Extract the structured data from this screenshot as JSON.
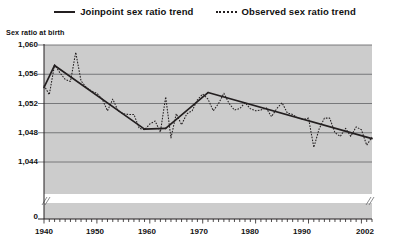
{
  "legend": {
    "items": [
      {
        "label": "Joinpoint sex ratio trend",
        "style": "solid",
        "color": "#231f20",
        "icon": "solid-line-icon"
      },
      {
        "label": "Observed sex ratio trend",
        "style": "dotted",
        "color": "#231f20",
        "icon": "dotted-line-icon"
      }
    ]
  },
  "axes": {
    "y_title": "Sex ratio at birth",
    "y_ticks": [
      "1,060",
      "1,056",
      "1,052",
      "1,048",
      "1,044",
      "0"
    ],
    "x_ticks": [
      "1940",
      "1950",
      "1960",
      "1970",
      "1980",
      "1990",
      "2002"
    ]
  },
  "colors": {
    "plot_background": "#cccccc",
    "gridline": "#6d6e71",
    "line": "#231f20",
    "axis": "#231f20",
    "break_band": "#ffffff"
  },
  "chart_data": {
    "type": "line",
    "title": "",
    "xlabel": "",
    "ylabel": "Sex ratio at birth",
    "xlim": [
      1940,
      2002
    ],
    "ylim": [
      1042,
      1060
    ],
    "ytick_values": [
      1060,
      1056,
      1052,
      1048,
      1044
    ],
    "xtick_values": [
      1940,
      1950,
      1960,
      1970,
      1980,
      1990,
      2002
    ],
    "grid": "horizontal",
    "legend_position": "top-center",
    "axis_break": true,
    "x": [
      1940,
      1941,
      1942,
      1943,
      1944,
      1945,
      1946,
      1947,
      1948,
      1949,
      1950,
      1951,
      1952,
      1953,
      1954,
      1955,
      1956,
      1957,
      1958,
      1959,
      1960,
      1961,
      1962,
      1963,
      1964,
      1965,
      1966,
      1967,
      1968,
      1969,
      1970,
      1971,
      1972,
      1973,
      1974,
      1975,
      1976,
      1977,
      1978,
      1979,
      1980,
      1981,
      1982,
      1983,
      1984,
      1985,
      1986,
      1987,
      1988,
      1989,
      1990,
      1991,
      1992,
      1993,
      1994,
      1995,
      1996,
      1997,
      1998,
      1999,
      2000,
      2001,
      2002
    ],
    "series": [
      {
        "name": "Observed sex ratio trend",
        "style": "dotted",
        "values": [
          1054.5,
          1053.2,
          1057.3,
          1056.2,
          1055.3,
          1055.0,
          1059.0,
          1055.1,
          1054.2,
          1053.7,
          1053.4,
          1052.6,
          1051.0,
          1052.6,
          1051.0,
          1050.6,
          1050.5,
          1050.5,
          1048.6,
          1048.4,
          1049.2,
          1049.6,
          1048.1,
          1052.9,
          1047.3,
          1050.6,
          1049.1,
          1050.6,
          1051.0,
          1052.5,
          1053.3,
          1052.6,
          1051.0,
          1052.0,
          1053.4,
          1052.0,
          1051.1,
          1051.3,
          1052.1,
          1051.3,
          1051.0,
          1051.1,
          1051.4,
          1050.2,
          1051.3,
          1052.1,
          1050.7,
          1050.5,
          1050.0,
          1049.8,
          1050.0,
          1046.0,
          1048.5,
          1050.0,
          1050.0,
          1048.0,
          1047.5,
          1048.6,
          1047.5,
          1048.8,
          1048.4,
          1046.3,
          1047.4
        ]
      },
      {
        "name": "Joinpoint sex ratio trend",
        "style": "solid",
        "segments": [
          {
            "x": [
              1940,
              1942
            ],
            "y": [
              1054.2,
              1057.2
            ]
          },
          {
            "x": [
              1942,
              1959
            ],
            "y": [
              1057.2,
              1048.5
            ]
          },
          {
            "x": [
              1959,
              1963
            ],
            "y": [
              1048.5,
              1048.6
            ]
          },
          {
            "x": [
              1963,
              1971
            ],
            "y": [
              1048.6,
              1053.5
            ]
          },
          {
            "x": [
              1971,
              2002
            ],
            "y": [
              1053.5,
              1047.2
            ]
          }
        ]
      }
    ]
  }
}
